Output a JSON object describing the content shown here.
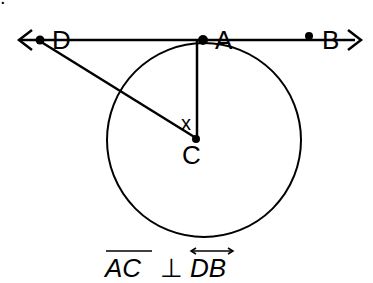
{
  "diagram": {
    "points": {
      "D": {
        "label": "D",
        "x": 38,
        "y": 40
      },
      "A": {
        "label": "A",
        "x": 202,
        "y": 40
      },
      "B": {
        "label": "B",
        "x": 308,
        "y": 39
      },
      "C": {
        "label": "C",
        "x": 196,
        "y": 138
      }
    },
    "angle_label": "x",
    "caption": {
      "seg1": "AC",
      "perp": "⊥",
      "seg2": "DB"
    },
    "top_fragment": "."
  }
}
